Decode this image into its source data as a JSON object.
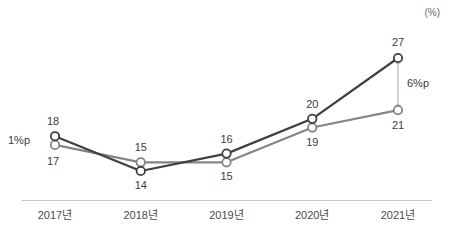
{
  "chart_data": {
    "type": "line",
    "title": "",
    "subtitle": "",
    "xlabel": "",
    "ylabel": "",
    "unit_label": "(%)",
    "categories": [
      "2017년",
      "2018년",
      "2019년",
      "2020년",
      "2021년"
    ],
    "ylim": [
      12,
      29
    ],
    "grid": false,
    "legend_position": "none",
    "series": [
      {
        "name": "series-dark",
        "color": "#3f3f3f",
        "values": [
          18,
          14,
          16,
          20,
          27
        ],
        "label_positions": [
          "above",
          "below",
          "above",
          "above",
          "above"
        ]
      },
      {
        "name": "series-gray",
        "color": "#858585",
        "values": [
          17,
          15,
          15,
          19,
          21
        ],
        "label_positions": [
          "below",
          "above",
          "below",
          "below",
          "below"
        ]
      }
    ],
    "annotations": [
      {
        "name": "gap-2017",
        "text": "1%p",
        "category": "2017년",
        "value_from": 17,
        "value_to": 18
      },
      {
        "name": "gap-2021",
        "text": "6%p",
        "category": "2021년",
        "value_from": 21,
        "value_to": 27
      }
    ]
  },
  "axis": {
    "line_color": "#c8c8c8",
    "tick_labels": [
      "2017년",
      "2018년",
      "2019년",
      "2020년",
      "2021년"
    ]
  },
  "data_labels": {
    "dark": [
      "18",
      "14",
      "16",
      "20",
      "27"
    ],
    "gray": [
      "17",
      "15",
      "15",
      "19",
      "21"
    ]
  },
  "annotation_labels": {
    "left": "1%p",
    "right": "6%p"
  }
}
